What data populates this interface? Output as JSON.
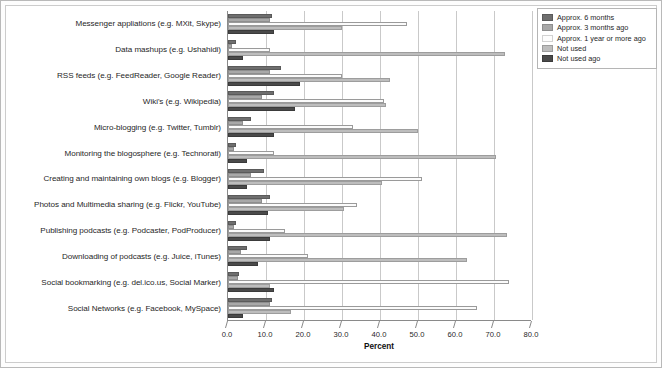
{
  "chart_data": {
    "type": "bar",
    "orientation": "horizontal",
    "title": "",
    "xlabel": "Percent",
    "ylabel": "",
    "xlim": [
      0.0,
      80.0
    ],
    "xticks": [
      "0.0",
      "10.0",
      "20.0",
      "30.0",
      "40.0",
      "50.0",
      "60.0",
      "70.0",
      "80.0"
    ],
    "grid": "vertical",
    "legend_position": "outside-right-top",
    "categories": [
      "Messenger appliations (e.g. MXit, Skype)",
      "Data mashups (e.g. Ushahidi)",
      "RSS feeds (e.g. FeedReader, Google Reader)",
      "Wiki's (e.g. Wikipedia)",
      "Micro-blogging (e.g. Twitter, Tumblr)",
      "Monitoring the blogosphere (e.g. Technorati)",
      "Creating and maintaining own blogs (e.g. Blogger)",
      "Photos and Multimedia sharing (e.g. Flickr, YouTube)",
      "Publishing podcasts (e.g. Podcaster, PodProducer)",
      "Downloading of podcasts (e.g. Juice, iTunes)",
      "Social bookmarking (e.g. del.ico.us, Social Marker)",
      "Social Networks (e.g. Facebook, MySpace)"
    ],
    "series": [
      {
        "name": "Approx. 6 months",
        "color": "#6e6e6e",
        "values": [
          11.5,
          2.0,
          14.0,
          12.0,
          6.0,
          2.0,
          9.5,
          11.0,
          2.0,
          5.0,
          3.0,
          11.5
        ]
      },
      {
        "name": "Approx. 3 months ago",
        "color": "#a8a8a8",
        "values": [
          11.0,
          1.0,
          11.0,
          9.0,
          4.0,
          1.5,
          6.0,
          9.0,
          1.5,
          3.5,
          2.5,
          11.0
        ]
      },
      {
        "name": "Approx. 1 year or more ago",
        "color": "#fbfbfb",
        "values": [
          47.0,
          11.0,
          30.0,
          41.0,
          33.0,
          12.0,
          51.0,
          34.0,
          15.0,
          21.0,
          74.0,
          65.5
        ]
      },
      {
        "name": "Not used",
        "color": "#bdbdbd",
        "values": [
          30.0,
          73.0,
          42.5,
          41.5,
          50.0,
          70.5,
          40.5,
          30.5,
          73.5,
          63.0,
          11.0,
          16.5
        ]
      },
      {
        "name": "Not used ago",
        "color": "#4a4a4a",
        "values": [
          12.0,
          4.0,
          19.0,
          17.5,
          12.0,
          5.0,
          5.0,
          10.5,
          11.0,
          8.0,
          12.0,
          4.0
        ]
      }
    ]
  }
}
